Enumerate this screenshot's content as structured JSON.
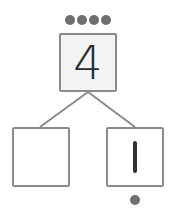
{
  "number_bond": {
    "whole": {
      "value": "4",
      "dots": 4
    },
    "parts": [
      {
        "value": "",
        "dots": 0
      },
      {
        "value": "1",
        "dots": 1
      }
    ]
  },
  "colors": {
    "box_border": "#8a8a8a",
    "dot": "#6e6e6e",
    "digit": "#2b2b2b",
    "top_fill": "#f4f4f4"
  }
}
